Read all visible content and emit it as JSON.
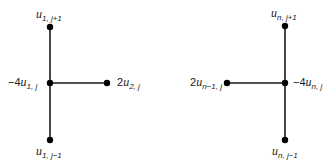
{
  "figure": {
    "left_stencil": {
      "top": {
        "coef": "",
        "var": "u",
        "sub": "1, j+1"
      },
      "center": {
        "coef": "−4",
        "var": "u",
        "sub": "1, j"
      },
      "right": {
        "coef": "2",
        "var": "u",
        "sub": "2, j"
      },
      "bottom": {
        "coef": "",
        "var": "u",
        "sub": "1, j−1"
      }
    },
    "right_stencil": {
      "top": {
        "coef": "",
        "var": "u",
        "sub": "n, j+1"
      },
      "center": {
        "coef": "−4",
        "var": "u",
        "sub": "n, j"
      },
      "left": {
        "coef": "2",
        "var": "u",
        "sub": "n−1, j"
      },
      "bottom": {
        "coef": "",
        "var": "u",
        "sub": "n, j−1"
      }
    },
    "colors": {
      "line": "#1a1a1a",
      "node": "#000000"
    }
  }
}
